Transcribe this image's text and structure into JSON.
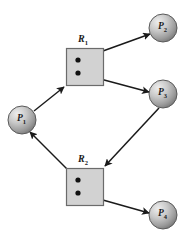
{
  "figure": {
    "type": "resource-allocation-graph",
    "background_color": "#ffffff",
    "edge_color": "#1a1a1a",
    "resource_fill": "#d2d2d2",
    "resource_stroke": "#6b6b6b",
    "process_fill_light": "#e6e6e6",
    "process_fill_dark": "#7d7d7d",
    "process_stroke": "#5a5a5a",
    "dot_color": "#111111"
  },
  "processes": [
    {
      "id": "P1",
      "name": "P",
      "sub": "1",
      "cx": 22,
      "cy": 120,
      "r": 14
    },
    {
      "id": "P2",
      "name": "P",
      "sub": "2",
      "cx": 163,
      "cy": 28,
      "r": 14
    },
    {
      "id": "P3",
      "name": "P",
      "sub": "3",
      "cx": 163,
      "cy": 94,
      "r": 14
    },
    {
      "id": "P4",
      "name": "P",
      "sub": "4",
      "cx": 163,
      "cy": 215,
      "r": 14
    }
  ],
  "resources": [
    {
      "id": "R1",
      "name": "R",
      "sub": "1",
      "x": 66,
      "y": 48,
      "w": 37,
      "h": 37,
      "label_x": 78,
      "label_y": 33,
      "instances": [
        {
          "cx": 78,
          "cy": 60
        },
        {
          "cx": 78,
          "cy": 73
        }
      ]
    },
    {
      "id": "R2",
      "name": "R",
      "sub": "2",
      "x": 66,
      "y": 168,
      "w": 37,
      "h": 37,
      "label_x": 78,
      "label_y": 153,
      "instances": [
        {
          "cx": 78,
          "cy": 180
        },
        {
          "cx": 78,
          "cy": 193
        }
      ]
    }
  ],
  "edges": [
    {
      "name": "p1-requests-r1",
      "kind": "request",
      "from": "P1",
      "to": "R1",
      "x1": 34,
      "y1": 111,
      "x2": 64,
      "y2": 87
    },
    {
      "name": "r1-assigned-p2",
      "kind": "assignment",
      "from": "R1",
      "to": "P2",
      "x1": 78,
      "y1": 60,
      "x2": 150,
      "y2": 34
    },
    {
      "name": "r1-assigned-p3",
      "kind": "assignment",
      "from": "R1",
      "to": "P3",
      "x1": 78,
      "y1": 73,
      "x2": 149,
      "y2": 92
    },
    {
      "name": "p3-requests-r2",
      "kind": "request",
      "from": "P3",
      "to": "R2",
      "x1": 159,
      "y1": 108,
      "x2": 105,
      "y2": 166
    },
    {
      "name": "r2-assigned-p1",
      "kind": "assignment",
      "from": "R2",
      "to": "P1",
      "x1": 78,
      "y1": 180,
      "x2": 30,
      "y2": 132
    },
    {
      "name": "r2-assigned-p4",
      "kind": "assignment",
      "from": "R2",
      "to": "P4",
      "x1": 78,
      "y1": 193,
      "x2": 149,
      "y2": 213
    }
  ]
}
